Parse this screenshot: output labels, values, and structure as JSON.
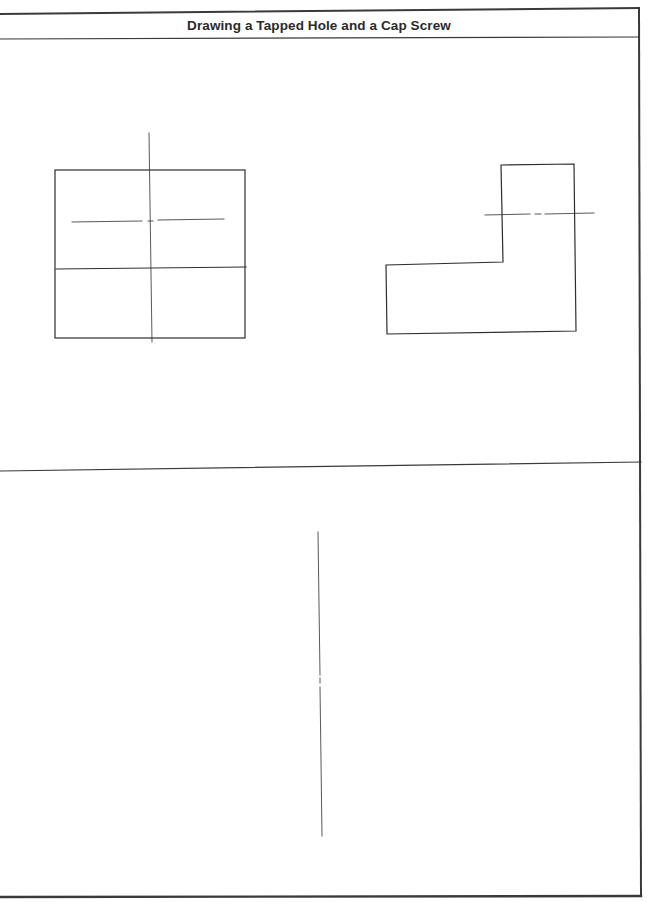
{
  "sheet": {
    "title": "Drawing a Tapped Hole and a Cap Screw",
    "line_color": "#2e2e2e",
    "border_color": "#3a3a3a"
  },
  "frame": {
    "top_border": {
      "x1": 0,
      "y1": 14,
      "x2": 639,
      "y2": 8
    },
    "right_border": {
      "x1": 639,
      "y1": 8,
      "x2": 641,
      "y2": 896
    },
    "bottom_border": {
      "x1": 0,
      "y1": 897,
      "x2": 641,
      "y2": 896
    },
    "title_underline": {
      "x1": 0,
      "y1": 39,
      "x2": 639,
      "y2": 37
    },
    "section_divider": {
      "x1": 0,
      "y1": 471,
      "x2": 641,
      "y2": 462
    }
  },
  "upper_left_view": {
    "outer_rect": {
      "x": 55,
      "y": 170,
      "width": 190,
      "height": 168
    },
    "mid_line": {
      "x1": 56,
      "y1": 269,
      "x2": 246,
      "y2": 267
    },
    "vertical_centerline": {
      "x1": 149,
      "y1": 133,
      "x2": 152,
      "y2": 342
    },
    "horizontal_centerline": [
      {
        "x1": 72,
        "y1": 222,
        "x2": 142,
        "y2": 221
      },
      {
        "x1": 148,
        "y1": 221,
        "x2": 153,
        "y2": 221
      },
      {
        "x1": 158,
        "y1": 220,
        "x2": 224,
        "y2": 219
      }
    ]
  },
  "upper_right_view": {
    "l_shape_points": "501,165 574,164 576,331 387,334 386,265 503,262",
    "horizontal_centerline": [
      {
        "x1": 485,
        "y1": 215,
        "x2": 530,
        "y2": 214
      },
      {
        "x1": 535,
        "y1": 214,
        "x2": 541,
        "y2": 214
      },
      {
        "x1": 545,
        "y1": 214,
        "x2": 594,
        "y2": 213
      }
    ]
  },
  "lower_section": {
    "vertical_centerline": [
      {
        "x1": 318,
        "y1": 532,
        "x2": 320,
        "y2": 675
      },
      {
        "x1": 320,
        "y1": 678,
        "x2": 320,
        "y2": 683
      },
      {
        "x1": 320,
        "y1": 687,
        "x2": 322,
        "y2": 836
      }
    ]
  }
}
